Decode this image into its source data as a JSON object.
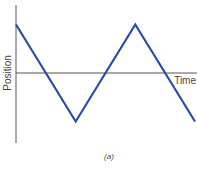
{
  "chart_data": {
    "type": "line",
    "title": "",
    "caption": "(a)",
    "xlabel": "Time",
    "ylabel": "Position",
    "x_ticks": [],
    "y_ticks": [],
    "grid": false,
    "legend": "none",
    "xlim": [
      0,
      3
    ],
    "ylim": [
      -1.45,
      1.4
    ],
    "series": [
      {
        "name": "position",
        "color": "#2b4aa8",
        "x": [
          0,
          1,
          2,
          3
        ],
        "y": [
          1,
          -1,
          1,
          -1
        ]
      }
    ]
  }
}
